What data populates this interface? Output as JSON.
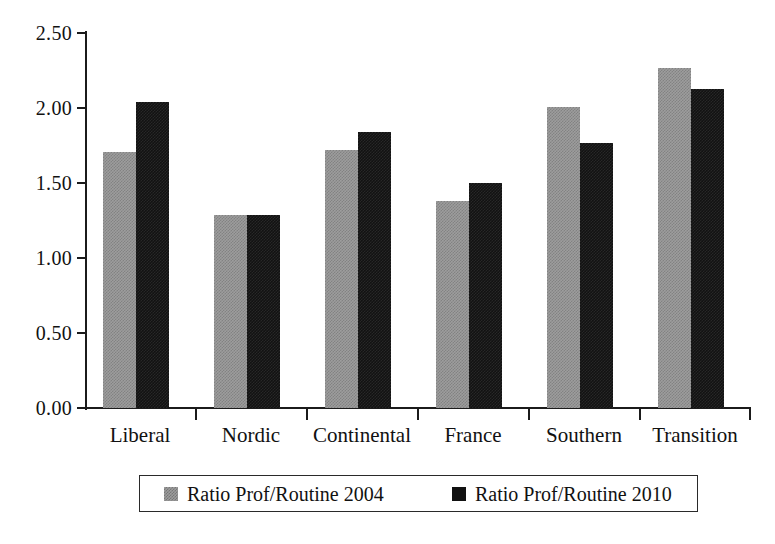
{
  "chart_data": {
    "type": "bar",
    "title": "",
    "xlabel": "",
    "ylabel": "",
    "ylim": [
      0.0,
      2.5
    ],
    "ytick_labels": [
      "2.50",
      "2.00",
      "1.50",
      "1.00",
      "0.50",
      "0.00"
    ],
    "ytick_values": [
      2.5,
      2.0,
      1.5,
      1.0,
      0.5,
      0.0
    ],
    "grid": false,
    "legend_position": "bottom",
    "categories": [
      "Liberal",
      "Nordic",
      "Continental",
      "France",
      "Southern",
      "Transition"
    ],
    "series": [
      {
        "name": "Ratio Prof/Routine 2004",
        "color": "#9d9d9d",
        "values": [
          1.71,
          1.29,
          1.72,
          1.38,
          2.01,
          2.27
        ]
      },
      {
        "name": "Ratio Prof/Routine 2010",
        "color": "#121212",
        "values": [
          2.04,
          1.29,
          1.84,
          1.5,
          1.77,
          2.13
        ]
      }
    ]
  },
  "legend": {
    "entries": [
      {
        "label": "Ratio Prof/Routine 2004",
        "swatch": "gray-swatch-icon"
      },
      {
        "label": "Ratio Prof/Routine 2010",
        "swatch": "black-swatch-icon"
      }
    ]
  }
}
